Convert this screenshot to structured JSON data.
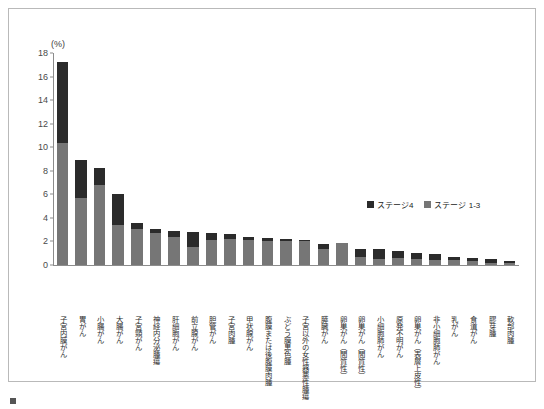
{
  "chart_data": {
    "type": "bar",
    "stacked": true,
    "title": "",
    "subtitle": "",
    "xlabel": "",
    "ylabel": "(%)",
    "unit_label": "(%)",
    "ylim": [
      0,
      18
    ],
    "ytick_step": 2,
    "yticks": [
      "18",
      "16",
      "14",
      "12",
      "10",
      "8",
      "6",
      "4",
      "2",
      "0"
    ],
    "grid": false,
    "legend_position": "upper-right-inside",
    "categories": [
      "子宮内膜がん",
      "胃がん",
      "小腸がん",
      "大腸がん",
      "子宮頸がん",
      "神経内分泌腫瘍",
      "肝細胞がん",
      "前立腺がん",
      "胆管がん",
      "子宮肉腫",
      "甲状腺がん",
      "腹膜または後腹膜肉腫",
      "ぶどう膜黒色腫",
      "子宮以外の女性器悪性腫瘍",
      "膵臓がん",
      "卵巣がん（間質性）",
      "卵巣がん（間質性）",
      "小細胞肺がん",
      "原発不明がん",
      "卵巣がん（表層上皮性）",
      "非小細胞肺がん",
      "乳がん",
      "食道がん",
      "膠芽腫",
      "軟部肉腫"
    ],
    "series": [
      {
        "name": "ステージ 1-3",
        "color": "#767676",
        "values": [
          10.4,
          5.7,
          6.8,
          3.4,
          3.1,
          2.7,
          2.4,
          1.5,
          2.1,
          2.2,
          2.1,
          2.0,
          2.0,
          2.0,
          1.4,
          1.9,
          0.7,
          0.5,
          0.6,
          0.5,
          0.4,
          0.4,
          0.3,
          0.2,
          0.2
        ]
      },
      {
        "name": "ステージ4",
        "color": "#2b2b2b",
        "values": [
          6.8,
          3.2,
          1.4,
          2.6,
          0.5,
          0.4,
          0.5,
          1.3,
          0.6,
          0.4,
          0.3,
          0.3,
          0.2,
          0.1,
          0.4,
          0.0,
          0.7,
          0.9,
          0.6,
          0.5,
          0.5,
          0.3,
          0.3,
          0.3,
          0.1
        ]
      }
    ],
    "totals": [
      17.2,
      8.9,
      8.2,
      6.0,
      3.6,
      3.1,
      2.9,
      2.8,
      2.7,
      2.6,
      2.4,
      2.3,
      2.2,
      2.1,
      1.8,
      1.9,
      1.4,
      1.4,
      1.2,
      1.0,
      0.9,
      0.7,
      0.6,
      0.5,
      0.3
    ]
  },
  "legend": {
    "items": [
      {
        "label": "ステージ4",
        "color": "#2b2b2b"
      },
      {
        "label": "ステージ 1-3",
        "color": "#767676"
      }
    ]
  },
  "caption": {
    "text": ""
  }
}
